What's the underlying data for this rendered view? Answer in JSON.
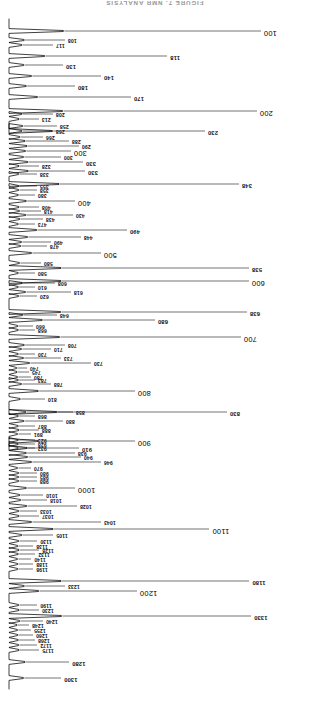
{
  "figure": {
    "title": "FIGURE 7.  NMR ANALYSIS",
    "type": "spectrum-trace",
    "orientation": "rotated-180",
    "axis_label_unit": "",
    "baseline_x_px": 300,
    "trace_color": "#000000"
  },
  "chart_data": {
    "type": "line",
    "title": "FIGURE 7.  NMR ANALYSIS",
    "xlabel": "",
    "ylabel": "",
    "grid": false,
    "legend": null,
    "orientation": "vertical-trace-baseline-right-rotated-180",
    "xlim": [
      90,
      1320
    ],
    "ylim": [
      0,
      230
    ],
    "note": "Peak positions are the retention/index values printed beside each leader line; values are peak relative intensity (leader-line length in px).",
    "peaks": [
      {
        "label": "1300",
        "pos": 1300,
        "y": 31,
        "len": 52,
        "size": "mid"
      },
      {
        "label": "1280",
        "pos": 1280,
        "y": 47,
        "len": 60,
        "size": "mid"
      },
      {
        "label": "1175",
        "pos": 1175,
        "y": 59,
        "len": 30,
        "size": "small"
      },
      {
        "label": "1172",
        "pos": 1172,
        "y": 64,
        "len": 28,
        "size": "small"
      },
      {
        "label": "1268",
        "pos": 1268,
        "y": 69,
        "len": 26,
        "size": "small"
      },
      {
        "label": "1260",
        "pos": 1260,
        "y": 74,
        "len": 24,
        "size": "small"
      },
      {
        "label": "1255",
        "pos": 1255,
        "y": 79,
        "len": 22,
        "size": "small"
      },
      {
        "label": "1248",
        "pos": 1248,
        "y": 84,
        "len": 20,
        "size": "small"
      },
      {
        "label": "1240",
        "pos": 1240,
        "y": 88,
        "len": 34,
        "size": "small"
      },
      {
        "label": "1330",
        "pos": 1330,
        "y": 93,
        "len": 242,
        "size": "mid"
      },
      {
        "label": "1230",
        "pos": 1230,
        "y": 99,
        "len": 30,
        "size": "small"
      },
      {
        "label": "1190",
        "pos": 1190,
        "y": 104,
        "len": 28,
        "size": "small"
      },
      {
        "label": "1200",
        "pos": 1200,
        "y": 118,
        "len": 128,
        "size": "big"
      },
      {
        "label": "1233",
        "pos": 1233,
        "y": 123,
        "len": 56,
        "size": "small"
      },
      {
        "label": "1180",
        "pos": 1180,
        "y": 128,
        "len": 240,
        "size": "mid"
      },
      {
        "label": "1198",
        "pos": 1198,
        "y": 140,
        "len": 24,
        "size": "small"
      },
      {
        "label": "1188",
        "pos": 1188,
        "y": 145,
        "len": 24,
        "size": "small"
      },
      {
        "label": "1140",
        "pos": 1140,
        "y": 150,
        "len": 22,
        "size": "small"
      },
      {
        "label": "1132",
        "pos": 1132,
        "y": 155,
        "len": 26,
        "size": "small"
      },
      {
        "label": "1128",
        "pos": 1128,
        "y": 159,
        "len": 30,
        "size": "small"
      },
      {
        "label": "1138",
        "pos": 1138,
        "y": 163,
        "len": 24,
        "size": "small"
      },
      {
        "label": "1130",
        "pos": 1130,
        "y": 168,
        "len": 28,
        "size": "small"
      },
      {
        "label": "1105",
        "pos": 1105,
        "y": 174,
        "len": 44,
        "size": "small"
      },
      {
        "label": "1100",
        "pos": 1100,
        "y": 180,
        "len": 200,
        "size": "big"
      },
      {
        "label": "1043",
        "pos": 1043,
        "y": 187,
        "len": 92,
        "size": "small"
      },
      {
        "label": "1037",
        "pos": 1037,
        "y": 193,
        "len": 30,
        "size": "small"
      },
      {
        "label": "1033",
        "pos": 1033,
        "y": 198,
        "len": 28,
        "size": "small"
      },
      {
        "label": "1028",
        "pos": 1028,
        "y": 203,
        "len": 68,
        "size": "small"
      },
      {
        "label": "1018",
        "pos": 1018,
        "y": 209,
        "len": 38,
        "size": "small"
      },
      {
        "label": "1010",
        "pos": 1010,
        "y": 214,
        "len": 34,
        "size": "small"
      },
      {
        "label": "1000",
        "pos": 1000,
        "y": 221,
        "len": 66,
        "size": "big"
      },
      {
        "label": "988",
        "pos": 988,
        "y": 228,
        "len": 28,
        "size": "small"
      },
      {
        "label": "985",
        "pos": 985,
        "y": 232,
        "len": 28,
        "size": "small"
      },
      {
        "label": "980",
        "pos": 980,
        "y": 236,
        "len": 28,
        "size": "small"
      },
      {
        "label": "970",
        "pos": 970,
        "y": 241,
        "len": 22,
        "size": "small"
      },
      {
        "label": "946",
        "pos": 946,
        "y": 247,
        "len": 92,
        "size": "small"
      },
      {
        "label": "940",
        "pos": 940,
        "y": 252,
        "len": 72,
        "size": "small"
      },
      {
        "label": "938",
        "pos": 938,
        "y": 256,
        "len": 66,
        "size": "small"
      },
      {
        "label": "932",
        "pos": 932,
        "y": 261,
        "len": 26,
        "size": "small"
      },
      {
        "label": "928",
        "pos": 928,
        "y": 265,
        "len": 26,
        "size": "small"
      },
      {
        "label": "923",
        "pos": 923,
        "y": 269,
        "len": 26,
        "size": "small"
      },
      {
        "label": "910",
        "pos": 910,
        "y": 261,
        "len": 70,
        "size": "mid"
      },
      {
        "label": "900",
        "pos": 900,
        "y": 268,
        "len": 126,
        "size": "big"
      },
      {
        "label": "891",
        "pos": 891,
        "y": 275,
        "len": 22,
        "size": "small"
      },
      {
        "label": "888",
        "pos": 888,
        "y": 279,
        "len": 30,
        "size": "small"
      },
      {
        "label": "887",
        "pos": 887,
        "y": 283,
        "len": 26,
        "size": "small"
      },
      {
        "label": "880",
        "pos": 880,
        "y": 288,
        "len": 54,
        "size": "small"
      },
      {
        "label": "868",
        "pos": 868,
        "y": 293,
        "len": 26,
        "size": "small"
      },
      {
        "label": "858",
        "pos": 858,
        "y": 297,
        "len": 64,
        "size": "small"
      },
      {
        "label": "830",
        "pos": 830,
        "y": 297,
        "len": 218,
        "size": "mid"
      },
      {
        "label": "810",
        "pos": 810,
        "y": 310,
        "len": 36,
        "size": "small"
      },
      {
        "label": "800",
        "pos": 800,
        "y": 318,
        "len": 126,
        "size": "big"
      },
      {
        "label": "788",
        "pos": 788,
        "y": 325,
        "len": 42,
        "size": "small"
      },
      {
        "label": "783",
        "pos": 783,
        "y": 329,
        "len": 26,
        "size": "small"
      },
      {
        "label": "780",
        "pos": 780,
        "y": 332,
        "len": 22,
        "size": "small"
      },
      {
        "label": "745",
        "pos": 745,
        "y": 337,
        "len": 20,
        "size": "small"
      },
      {
        "label": "740",
        "pos": 740,
        "y": 341,
        "len": 18,
        "size": "small"
      },
      {
        "label": "730",
        "pos": 730,
        "y": 346,
        "len": 82,
        "size": "small"
      },
      {
        "label": "733",
        "pos": 733,
        "y": 351,
        "len": 52,
        "size": "small"
      },
      {
        "label": "730b",
        "pos": 730,
        "y": 355,
        "len": 26,
        "size": "small"
      },
      {
        "label": "710",
        "pos": 710,
        "y": 360,
        "len": 42,
        "size": "small"
      },
      {
        "label": "708",
        "pos": 708,
        "y": 364,
        "len": 56,
        "size": "small"
      },
      {
        "label": "700",
        "pos": 700,
        "y": 372,
        "len": 232,
        "size": "big"
      },
      {
        "label": "668",
        "pos": 668,
        "y": 379,
        "len": 26,
        "size": "small"
      },
      {
        "label": "660",
        "pos": 660,
        "y": 383,
        "len": 24,
        "size": "small"
      },
      {
        "label": "680",
        "pos": 680,
        "y": 389,
        "len": 146,
        "size": "mid"
      },
      {
        "label": "648",
        "pos": 648,
        "y": 394,
        "len": 48,
        "size": "small"
      },
      {
        "label": "638",
        "pos": 638,
        "y": 397,
        "len": 238,
        "size": "mid"
      },
      {
        "label": "620",
        "pos": 620,
        "y": 413,
        "len": 28,
        "size": "small"
      },
      {
        "label": "618",
        "pos": 618,
        "y": 417,
        "len": 62,
        "size": "small"
      },
      {
        "label": "610",
        "pos": 610,
        "y": 422,
        "len": 26,
        "size": "small"
      },
      {
        "label": "608",
        "pos": 608,
        "y": 426,
        "len": 46,
        "size": "small"
      },
      {
        "label": "600",
        "pos": 600,
        "y": 428,
        "len": 240,
        "size": "big"
      },
      {
        "label": "580",
        "pos": 580,
        "y": 436,
        "len": 26,
        "size": "small"
      },
      {
        "label": "538",
        "pos": 538,
        "y": 441,
        "len": 240,
        "size": "mid"
      },
      {
        "label": "580b",
        "pos": 580,
        "y": 446,
        "len": 32,
        "size": "small"
      },
      {
        "label": "500",
        "pos": 500,
        "y": 456,
        "len": 92,
        "size": "big"
      },
      {
        "label": "478",
        "pos": 478,
        "y": 463,
        "len": 38,
        "size": "small"
      },
      {
        "label": "490",
        "pos": 490,
        "y": 467,
        "len": 42,
        "size": "small"
      },
      {
        "label": "448",
        "pos": 448,
        "y": 472,
        "len": 72,
        "size": "small"
      },
      {
        "label": "490b",
        "pos": 490,
        "y": 479,
        "len": 118,
        "size": "mid"
      },
      {
        "label": "473",
        "pos": 473,
        "y": 485,
        "len": 26,
        "size": "small"
      },
      {
        "label": "438",
        "pos": 438,
        "y": 490,
        "len": 34,
        "size": "small"
      },
      {
        "label": "430",
        "pos": 430,
        "y": 494,
        "len": 64,
        "size": "small"
      },
      {
        "label": "418",
        "pos": 418,
        "y": 498,
        "len": 32,
        "size": "small"
      },
      {
        "label": "408",
        "pos": 408,
        "y": 502,
        "len": 30,
        "size": "small"
      },
      {
        "label": "400",
        "pos": 400,
        "y": 508,
        "len": 66,
        "size": "big"
      },
      {
        "label": "380",
        "pos": 380,
        "y": 514,
        "len": 26,
        "size": "small"
      },
      {
        "label": "358",
        "pos": 358,
        "y": 519,
        "len": 28,
        "size": "small"
      },
      {
        "label": "355",
        "pos": 355,
        "y": 523,
        "len": 28,
        "size": "small"
      },
      {
        "label": "348",
        "pos": 348,
        "y": 525,
        "len": 230,
        "size": "mid"
      },
      {
        "label": "338",
        "pos": 338,
        "y": 535,
        "len": 28,
        "size": "small"
      },
      {
        "label": "330",
        "pos": 330,
        "y": 538,
        "len": 76,
        "size": "mid"
      },
      {
        "label": "328",
        "pos": 328,
        "y": 543,
        "len": 30,
        "size": "small"
      },
      {
        "label": "330b",
        "pos": 330,
        "y": 547,
        "len": 74,
        "size": "mid"
      },
      {
        "label": "300",
        "pos": 300,
        "y": 552,
        "len": 52,
        "size": "small"
      },
      {
        "label": "300c",
        "pos": 300,
        "y": 558,
        "len": 62,
        "size": "big"
      },
      {
        "label": "290",
        "pos": 290,
        "y": 563,
        "len": 70,
        "size": "small"
      },
      {
        "label": "288",
        "pos": 288,
        "y": 568,
        "len": 60,
        "size": "small"
      },
      {
        "label": "266",
        "pos": 266,
        "y": 572,
        "len": 34,
        "size": "small"
      },
      {
        "label": "268",
        "pos": 268,
        "y": 578,
        "len": 44,
        "size": "small"
      },
      {
        "label": "258",
        "pos": 258,
        "y": 583,
        "len": 48,
        "size": "small"
      },
      {
        "label": "230",
        "pos": 230,
        "y": 578,
        "len": 196,
        "size": "mid"
      },
      {
        "label": "213",
        "pos": 213,
        "y": 590,
        "len": 30,
        "size": "small"
      },
      {
        "label": "208",
        "pos": 208,
        "y": 595,
        "len": 44,
        "size": "small"
      },
      {
        "label": "200",
        "pos": 200,
        "y": 598,
        "len": 248,
        "size": "big"
      },
      {
        "label": "170",
        "pos": 170,
        "y": 612,
        "len": 122,
        "size": "mid"
      },
      {
        "label": "180",
        "pos": 180,
        "y": 623,
        "len": 66,
        "size": "mid"
      },
      {
        "label": "140",
        "pos": 140,
        "y": 633,
        "len": 92,
        "size": "mid"
      },
      {
        "label": "130",
        "pos": 130,
        "y": 644,
        "len": 54,
        "size": "mid"
      },
      {
        "label": "118",
        "pos": 118,
        "y": 653,
        "len": 158,
        "size": "mid"
      },
      {
        "label": "117",
        "pos": 117,
        "y": 664,
        "len": 44,
        "size": "small"
      },
      {
        "label": "108",
        "pos": 108,
        "y": 669,
        "len": 56,
        "size": "small"
      },
      {
        "label": "100",
        "pos": 100,
        "y": 678,
        "len": 252,
        "size": "big"
      }
    ]
  }
}
